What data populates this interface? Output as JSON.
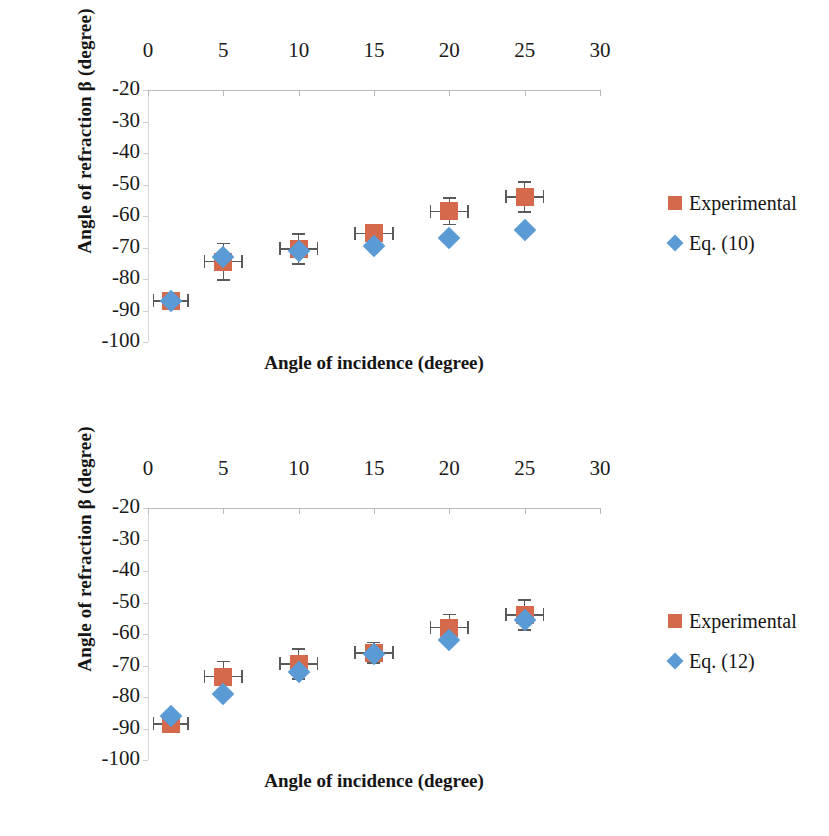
{
  "colors": {
    "experimental": "#d4694c",
    "equation": "#5b9bd5",
    "error_bar": "#5a5a5a",
    "axis": "#bdbdbd",
    "background": "#ffffff"
  },
  "chart_data": [
    {
      "type": "scatter",
      "panel": "top",
      "title": "",
      "xlabel": "Angle of incidence (degree)",
      "ylabel": "Angle of refraction β (degree)",
      "xlim": [
        0,
        30
      ],
      "ylim": [
        -100,
        -20
      ],
      "xticks": [
        "0",
        "5",
        "10",
        "15",
        "20",
        "25",
        "30"
      ],
      "yticks": [
        "-20",
        "-30",
        "-40",
        "-50",
        "-60",
        "-70",
        "-80",
        "-90",
        "-100"
      ],
      "xtick_values": [
        0,
        5,
        10,
        15,
        20,
        25,
        30
      ],
      "ytick_values": [
        -20,
        -30,
        -40,
        -50,
        -60,
        -70,
        -80,
        -90,
        -100
      ],
      "x_axis_position": "top",
      "grid": false,
      "legend_position": "right",
      "x": [
        1.5,
        5,
        10,
        15,
        20,
        25
      ],
      "series": [
        {
          "name": "Experimental",
          "marker": "square",
          "color": "#d4694c",
          "values": [
            -87,
            -74.5,
            -70.5,
            -65.5,
            -58.5,
            -54
          ],
          "yerr": [
            1.5,
            6,
            5,
            3,
            4.5,
            5
          ],
          "xerr": [
            1.2,
            1.3,
            1.3,
            1.3,
            1.3,
            1.3
          ]
        },
        {
          "name": "Eq. (10)",
          "marker": "diamond",
          "color": "#5b9bd5",
          "values": [
            -87,
            -73,
            -71,
            -69.5,
            -67,
            -64.5
          ],
          "yerr": [
            0,
            0,
            0,
            0,
            0,
            0
          ],
          "xerr": [
            0,
            0,
            0,
            0,
            0,
            0
          ]
        }
      ]
    },
    {
      "type": "scatter",
      "panel": "bottom",
      "title": "",
      "xlabel": "Angle of incidence (degree)",
      "ylabel": "Angle of refraction β (degree)",
      "xlim": [
        0,
        30
      ],
      "ylim": [
        -100,
        -20
      ],
      "xticks": [
        "0",
        "5",
        "10",
        "15",
        "20",
        "25",
        "30"
      ],
      "yticks": [
        "-20",
        "-30",
        "-40",
        "-50",
        "-60",
        "-70",
        "-80",
        "-90",
        "-100"
      ],
      "xtick_values": [
        0,
        5,
        10,
        15,
        20,
        25,
        30
      ],
      "ytick_values": [
        -20,
        -30,
        -40,
        -50,
        -60,
        -70,
        -80,
        -90,
        -100
      ],
      "x_axis_position": "top",
      "grid": false,
      "legend_position": "right",
      "x": [
        1.5,
        5,
        10,
        15,
        20,
        25
      ],
      "series": [
        {
          "name": "Experimental",
          "marker": "square",
          "color": "#d4694c",
          "values": [
            -88.5,
            -73.5,
            -69.5,
            -66,
            -58,
            -54
          ],
          "yerr": [
            1.5,
            5,
            5,
            3.5,
            4.5,
            5
          ],
          "xerr": [
            1.2,
            1.3,
            1.3,
            1.3,
            1.3,
            1.3
          ]
        },
        {
          "name": "Eq. (12)",
          "marker": "diamond",
          "color": "#5b9bd5",
          "values": [
            -86,
            -79,
            -72,
            -66.5,
            -62,
            -55.5
          ],
          "yerr": [
            0,
            0,
            0,
            0,
            0,
            0
          ],
          "xerr": [
            0,
            0,
            0,
            0,
            0,
            0
          ]
        }
      ]
    }
  ]
}
